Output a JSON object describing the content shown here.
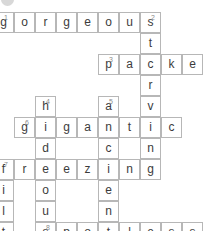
{
  "puzzle": {
    "type": "crossword",
    "cell_size": 21,
    "origin_x": 14,
    "origin_y": 12,
    "columns": 10,
    "rows": 11,
    "grid_color": "#b7b7b7",
    "letter_color": "#3c3c3c",
    "number_color": "#8a8a8a",
    "background": "#ffffff",
    "marker": {
      "name": "corner-dot",
      "color": "#d8d8d8"
    },
    "across_entries": [
      {
        "number": "1",
        "answer": "gorgeous",
        "row": 0,
        "col": 0,
        "length": 8
      },
      {
        "number": "3",
        "answer": "packed",
        "row": 2,
        "col": 5,
        "length": 6
      },
      {
        "number": "6",
        "answer": "gigantic",
        "row": 4,
        "col": 1,
        "length": 8
      },
      {
        "number": "7",
        "answer": "freezing",
        "row": 6,
        "col": 0,
        "length": 8
      },
      {
        "number": "8",
        "answer": "spotless",
        "row": 9,
        "col": 2,
        "length": 8
      }
    ],
    "down_entries": [
      {
        "number": "2",
        "answer": "starving",
        "row": 0,
        "col": 7,
        "length": 8
      },
      {
        "number": "4",
        "answer": "hideous",
        "row": 3,
        "col": 2,
        "length": 7
      },
      {
        "number": "5",
        "answer": "ancient",
        "row": 3,
        "col": 5,
        "length": 7
      },
      {
        "number": "7",
        "answer": "filthy",
        "row": 6,
        "col": 0,
        "length": 6
      }
    ],
    "cells": [
      {
        "row": 0,
        "col": 0,
        "letter": "g",
        "number": "1"
      },
      {
        "row": 0,
        "col": 1,
        "letter": "o",
        "number": ""
      },
      {
        "row": 0,
        "col": 2,
        "letter": "r",
        "number": ""
      },
      {
        "row": 0,
        "col": 3,
        "letter": "g",
        "number": ""
      },
      {
        "row": 0,
        "col": 4,
        "letter": "e",
        "number": ""
      },
      {
        "row": 0,
        "col": 5,
        "letter": "o",
        "number": ""
      },
      {
        "row": 0,
        "col": 6,
        "letter": "u",
        "number": ""
      },
      {
        "row": 0,
        "col": 7,
        "letter": "s",
        "number": "2"
      },
      {
        "row": 1,
        "col": 7,
        "letter": "t",
        "number": ""
      },
      {
        "row": 2,
        "col": 5,
        "letter": "p",
        "number": "3"
      },
      {
        "row": 2,
        "col": 6,
        "letter": "a",
        "number": ""
      },
      {
        "row": 2,
        "col": 7,
        "letter": "c",
        "number": ""
      },
      {
        "row": 2,
        "col": 8,
        "letter": "k",
        "number": ""
      },
      {
        "row": 2,
        "col": 9,
        "letter": "e",
        "number": ""
      },
      {
        "row": 2,
        "col": 10,
        "letter": "d",
        "number": ""
      },
      {
        "row": 3,
        "col": 7,
        "letter": "r",
        "number": ""
      },
      {
        "row": 4,
        "col": 2,
        "letter": "h",
        "number": "4"
      },
      {
        "row": 4,
        "col": 5,
        "letter": "a",
        "number": "5"
      },
      {
        "row": 4,
        "col": 7,
        "letter": "v",
        "number": ""
      },
      {
        "row": 5,
        "col": 1,
        "letter": "g",
        "number": "6"
      },
      {
        "row": 5,
        "col": 2,
        "letter": "i",
        "number": ""
      },
      {
        "row": 5,
        "col": 3,
        "letter": "g",
        "number": ""
      },
      {
        "row": 5,
        "col": 4,
        "letter": "a",
        "number": ""
      },
      {
        "row": 5,
        "col": 5,
        "letter": "n",
        "number": ""
      },
      {
        "row": 5,
        "col": 6,
        "letter": "t",
        "number": ""
      },
      {
        "row": 5,
        "col": 7,
        "letter": "i",
        "number": ""
      },
      {
        "row": 5,
        "col": 8,
        "letter": "c",
        "number": ""
      },
      {
        "row": 6,
        "col": 2,
        "letter": "d",
        "number": ""
      },
      {
        "row": 6,
        "col": 5,
        "letter": "c",
        "number": ""
      },
      {
        "row": 6,
        "col": 7,
        "letter": "n",
        "number": ""
      },
      {
        "row": 7,
        "col": 0,
        "letter": "f",
        "number": "7"
      },
      {
        "row": 7,
        "col": 1,
        "letter": "r",
        "number": ""
      },
      {
        "row": 7,
        "col": 2,
        "letter": "e",
        "number": ""
      },
      {
        "row": 7,
        "col": 3,
        "letter": "e",
        "number": ""
      },
      {
        "row": 7,
        "col": 4,
        "letter": "z",
        "number": ""
      },
      {
        "row": 7,
        "col": 5,
        "letter": "i",
        "number": ""
      },
      {
        "row": 7,
        "col": 6,
        "letter": "n",
        "number": ""
      },
      {
        "row": 7,
        "col": 7,
        "letter": "g",
        "number": ""
      },
      {
        "row": 8,
        "col": 0,
        "letter": "i",
        "number": ""
      },
      {
        "row": 8,
        "col": 2,
        "letter": "o",
        "number": ""
      },
      {
        "row": 8,
        "col": 5,
        "letter": "e",
        "number": ""
      },
      {
        "row": 9,
        "col": 0,
        "letter": "l",
        "number": ""
      },
      {
        "row": 9,
        "col": 2,
        "letter": "u",
        "number": ""
      },
      {
        "row": 9,
        "col": 5,
        "letter": "n",
        "number": ""
      },
      {
        "row": 10,
        "col": 0,
        "letter": "t",
        "number": ""
      },
      {
        "row": 10,
        "col": 2,
        "letter": "s",
        "number": "8"
      },
      {
        "row": 10,
        "col": 3,
        "letter": "p",
        "number": ""
      },
      {
        "row": 10,
        "col": 4,
        "letter": "o",
        "number": ""
      },
      {
        "row": 10,
        "col": 5,
        "letter": "t",
        "number": ""
      },
      {
        "row": 10,
        "col": 6,
        "letter": "l",
        "number": ""
      },
      {
        "row": 10,
        "col": 7,
        "letter": "e",
        "number": ""
      },
      {
        "row": 10,
        "col": 8,
        "letter": "s",
        "number": ""
      },
      {
        "row": 10,
        "col": 9,
        "letter": "s",
        "number": ""
      },
      {
        "row": 11,
        "col": 0,
        "letter": "h",
        "number": ""
      },
      {
        "row": 12,
        "col": 0,
        "letter": "y",
        "number": ""
      }
    ]
  }
}
